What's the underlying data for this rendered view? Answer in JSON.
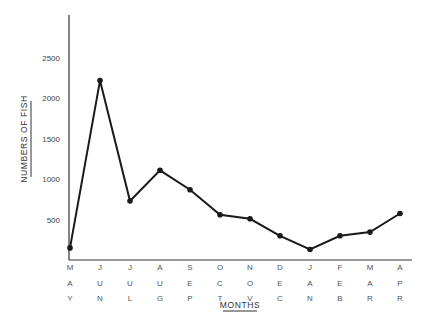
{
  "chart_data": {
    "type": "line",
    "title": "",
    "xlabel": "MONTHS",
    "ylabel": "NUMBERS OF FISH",
    "categories": [
      "MAY",
      "JUN",
      "JUL",
      "AUG",
      "SEP",
      "OCT",
      "NOV",
      "DEC",
      "JAN",
      "FEB",
      "MAR",
      "APR"
    ],
    "series": [
      {
        "name": "Numbers of fish",
        "values": [
          150,
          2220,
          730,
          1110,
          870,
          560,
          510,
          300,
          130,
          300,
          345,
          575
        ]
      }
    ],
    "yticks": [
      500,
      1000,
      1500,
      2000,
      2500
    ],
    "ylim": [
      0,
      3000
    ],
    "grid": false,
    "legend": null,
    "line_color": "#1a1a1a",
    "marker": "filled-circle"
  }
}
